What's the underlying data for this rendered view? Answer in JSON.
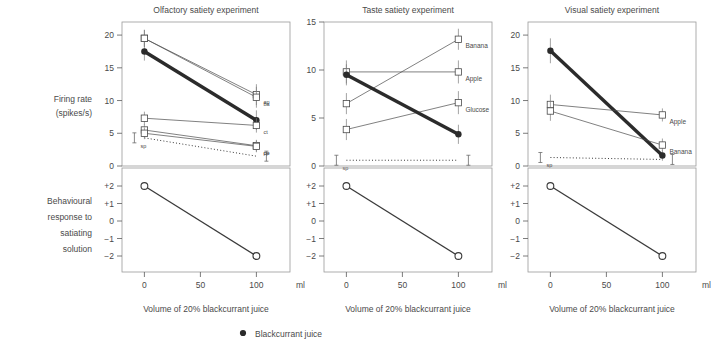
{
  "figure": {
    "xlabel": "Volume of 20% blackcurrant juice",
    "x_unit": "ml",
    "firing_rate_label_line1": "Firing rate",
    "firing_rate_label_line2": "(spikes/s)",
    "behaviour_label_line1": "Behavioural",
    "behaviour_label_line2": "response to",
    "behaviour_label_line3": "satiating",
    "behaviour_label_line4": "solution",
    "legend_label": "Blackcurrant juice",
    "legend_marker": "filled-circle",
    "spontaneous_label": "sp"
  },
  "chart_data": [
    {
      "type": "line",
      "title": "Olfactory satiety experiment",
      "xlabel": "Volume of 20% blackcurrant juice",
      "ylabel": "Firing rate (spikes/s)",
      "x": [
        0,
        100
      ],
      "xlim": [
        -20,
        130
      ],
      "xticks": [
        0,
        50,
        100
      ],
      "xticklabels": [
        "0",
        "50",
        "100"
      ],
      "ylim": [
        0,
        22
      ],
      "yticks": [
        0,
        5,
        10,
        15,
        20
      ],
      "yticklabels": [
        "0",
        "5",
        "10",
        "15",
        "20"
      ],
      "grid": false,
      "series": [
        {
          "name": "ap",
          "label": "ap",
          "marker": "square",
          "values": [
            19.5,
            10.9
          ],
          "errors": [
            1.3,
            1.6
          ],
          "style": "thin"
        },
        {
          "name": "blackcurrant",
          "label": "",
          "marker": "filled-circle",
          "values": [
            17.5,
            7.0
          ],
          "errors": [
            1.4,
            1.5
          ],
          "style": "thick"
        },
        {
          "name": "ba",
          "label": "ba",
          "marker": "square",
          "values": [
            19.5,
            10.5
          ],
          "errors": [
            1.3,
            1.6
          ],
          "style": "thin"
        },
        {
          "name": "ct",
          "label": "ct",
          "marker": "square",
          "values": [
            7.3,
            6.2
          ],
          "errors": [
            1.0,
            1.1
          ],
          "style": "thin"
        },
        {
          "name": "pe",
          "label": "pe",
          "marker": "square",
          "values": [
            5.5,
            3.1
          ],
          "errors": [
            0.9,
            0.9
          ],
          "style": "thin"
        },
        {
          "name": "cp",
          "label": "cp",
          "marker": "square",
          "values": [
            5.0,
            3.0
          ],
          "errors": [
            0.9,
            0.9
          ],
          "style": "thin"
        }
      ],
      "spontaneous": {
        "label": "sp",
        "value_start": 4.3,
        "value_end": 1.5
      },
      "behaviour": {
        "x": [
          0,
          100
        ],
        "values": [
          2,
          -2
        ],
        "yticks": [
          2,
          1,
          0,
          -1,
          -2
        ],
        "yticklabels": [
          "+2",
          "+1",
          "0",
          "−1",
          "−2"
        ]
      }
    },
    {
      "type": "line",
      "title": "Taste satiety experiment",
      "xlabel": "Volume of 20% blackcurrant juice",
      "ylabel": "Firing rate (spikes/s)",
      "x": [
        0,
        100
      ],
      "xlim": [
        -20,
        130
      ],
      "xticks": [
        0,
        50,
        100
      ],
      "xticklabels": [
        "0",
        "50",
        "100"
      ],
      "ylim": [
        0,
        15
      ],
      "yticks": [
        0,
        5,
        10,
        15
      ],
      "yticklabels": [
        "0",
        "5",
        "10",
        "15"
      ],
      "grid": false,
      "series": [
        {
          "name": "banana",
          "label": "Banana",
          "marker": "square",
          "values": [
            6.5,
            13.2
          ],
          "errors": [
            1.1,
            1.1
          ],
          "style": "thin"
        },
        {
          "name": "apple",
          "label": "Apple",
          "marker": "square",
          "values": [
            9.8,
            9.8
          ],
          "errors": [
            1.2,
            1.2
          ],
          "style": "thin"
        },
        {
          "name": "glucose",
          "label": "Glucose",
          "marker": "square",
          "values": [
            3.8,
            6.6
          ],
          "errors": [
            1.1,
            1.2
          ],
          "style": "thin"
        },
        {
          "name": "blackcurrant",
          "label": "",
          "marker": "filled-circle",
          "values": [
            9.5,
            3.3
          ],
          "errors": [
            1.1,
            1.0
          ],
          "style": "thick"
        }
      ],
      "spontaneous": {
        "label": "sp",
        "value_start": 0.6,
        "value_end": 0.6
      },
      "behaviour": {
        "x": [
          0,
          100
        ],
        "values": [
          2,
          -2
        ],
        "yticks": [
          2,
          1,
          0,
          -1,
          -2
        ],
        "yticklabels": [
          "+2",
          "+1",
          "0",
          "−1",
          "−2"
        ]
      }
    },
    {
      "type": "line",
      "title": "Visual satiety experiment",
      "xlabel": "Volume of 20% blackcurrant juice",
      "ylabel": "Firing rate (spikes/s)",
      "x": [
        0,
        100
      ],
      "xlim": [
        -20,
        130
      ],
      "xticks": [
        0,
        50,
        100
      ],
      "xticklabels": [
        "0",
        "50",
        "100"
      ],
      "ylim": [
        0,
        22
      ],
      "yticks": [
        0,
        5,
        10,
        15,
        20
      ],
      "yticklabels": [
        "0",
        "5",
        "10",
        "15",
        "20"
      ],
      "grid": false,
      "series": [
        {
          "name": "blackcurrant",
          "label": "",
          "marker": "filled-circle",
          "values": [
            17.6,
            1.6
          ],
          "errors": [
            1.9,
            0.8
          ],
          "style": "thick"
        },
        {
          "name": "apple",
          "label": "Apple",
          "marker": "square",
          "values": [
            9.4,
            7.8
          ],
          "errors": [
            1.5,
            1.0
          ],
          "style": "thin"
        },
        {
          "name": "banana",
          "label": "Banana",
          "marker": "square",
          "values": [
            8.4,
            3.2
          ],
          "errors": [
            1.5,
            1.0
          ],
          "style": "thin"
        }
      ],
      "spontaneous": {
        "label": "sp",
        "value_start": 1.3,
        "value_end": 1.0
      },
      "behaviour": {
        "x": [
          0,
          100
        ],
        "values": [
          2,
          -2
        ],
        "yticks": [
          2,
          1,
          0,
          -1,
          -2
        ],
        "yticklabels": [
          "+2",
          "+1",
          "0",
          "−1",
          "−2"
        ]
      }
    }
  ]
}
